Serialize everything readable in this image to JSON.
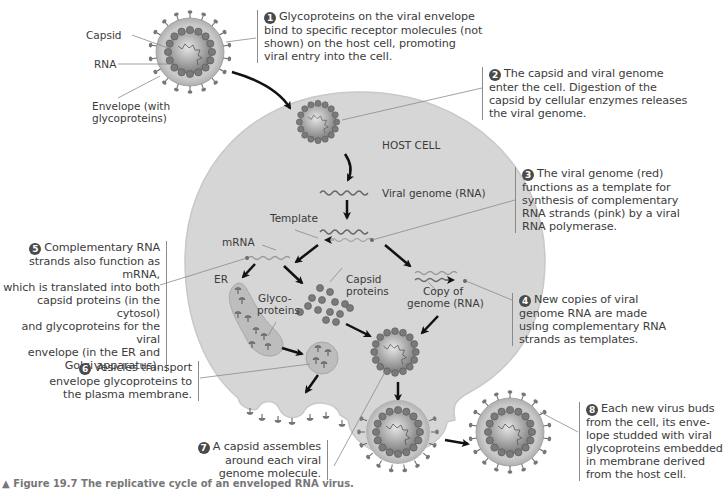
{
  "diagram": {
    "title": "Replicative cycle of an enveloped RNA virus",
    "colors": {
      "background": "#ffffff",
      "cell_fill": "#d7d7d7",
      "cell_edge": "#c4c4c4",
      "capsomere": "#7c7c7c",
      "envelope": "#b9b9b9",
      "text": "#3c3c3c",
      "arrow": "#111111"
    },
    "virus_labels": {
      "capsid": "Capsid",
      "rna": "RNA",
      "envelope": "Envelope (with glycoproteins)",
      "envelope_line1": "Envelope (with",
      "envelope_line2": "glycoproteins)"
    },
    "cell_labels": {
      "host_cell": "HOST CELL",
      "viral_genome": "Viral genome (RNA)",
      "template": "Template",
      "mrna": "mRNA",
      "er": "ER",
      "glyco_line1": "Glyco-",
      "glyco_line2": "proteins",
      "capsid_proteins_line1": "Capsid",
      "capsid_proteins_line2": "proteins",
      "copy_line1": "Copy of",
      "copy_line2": "genome (RNA)"
    },
    "steps": [
      {
        "number": "1",
        "lines": [
          "Glycoproteins on the viral envelope",
          "bind to specific receptor molecules (not",
          "shown) on the host cell, promoting",
          "viral entry into the cell."
        ]
      },
      {
        "number": "2",
        "lines": [
          "The capsid and viral genome",
          "enter the cell. Digestion of the",
          "capsid by cellular enzymes releases",
          "the viral genome."
        ]
      },
      {
        "number": "3",
        "lines": [
          "The viral genome (red)",
          "functions as a template for",
          "synthesis of complementary",
          "RNA strands (pink) by a viral",
          "RNA polymerase."
        ]
      },
      {
        "number": "4",
        "lines": [
          "New copies of viral",
          "genome RNA are made",
          "using complementary RNA",
          "strands as templates."
        ]
      },
      {
        "number": "5",
        "lines": [
          "Complementary RNA",
          "strands also function as mRNA,",
          "which is translated into both",
          "capsid proteins (in the cytosol)",
          "and glycoproteins for the viral",
          "envelope (in the ER and",
          "Golgi apparatus)."
        ]
      },
      {
        "number": "6",
        "lines": [
          "Vesicles transport",
          "envelope glycoproteins to",
          "the plasma membrane."
        ]
      },
      {
        "number": "7",
        "lines": [
          "A capsid assembles",
          "around each viral",
          "genome molecule."
        ]
      },
      {
        "number": "8",
        "lines": [
          "Each new virus buds",
          "from the cell, its enve-",
          "lope studded with viral",
          "glycoproteins embedded",
          "in membrane derived",
          "from the host cell."
        ]
      }
    ],
    "caption": "▲ Figure 19.7 The replicative cycle of an enveloped RNA virus."
  }
}
